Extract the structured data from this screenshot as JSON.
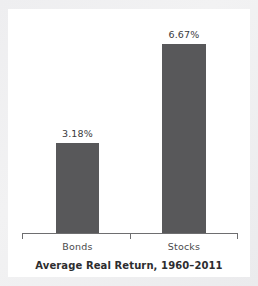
{
  "chart_data": {
    "type": "bar",
    "title": "Average Real Return, 1960–2011",
    "xlabel": "",
    "ylabel": "",
    "categories": [
      "Bonds",
      "Stocks"
    ],
    "values": [
      3.18,
      6.67
    ],
    "value_labels": [
      "3.18%",
      "6.67%"
    ],
    "unit": "%",
    "ylim": [
      0,
      7.8
    ],
    "grid": false,
    "legend": false,
    "bar_color": "#58585a",
    "axis_color": "#6e6e70",
    "background": "#ffffff",
    "page_background": "#efeff0",
    "axis_ticks": [
      "left-end",
      "center",
      "right-end"
    ]
  }
}
